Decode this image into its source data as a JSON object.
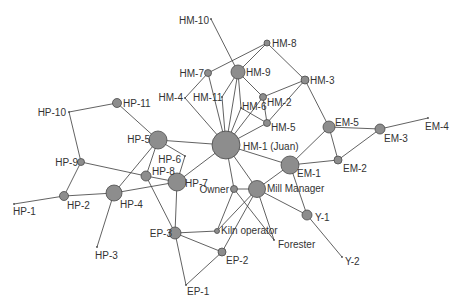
{
  "diagram": {
    "title": "",
    "colors": {
      "node_fill": "#8d8d8d",
      "node_stroke": "#4a4a4a",
      "edge": "#3a3a3a",
      "label": "#333333",
      "background": "#ffffff"
    },
    "nodes": [
      {
        "id": "HM-10",
        "label": "HM-10",
        "x": 211,
        "y": 19,
        "r": 0,
        "lx": 209,
        "ly": 24,
        "anchor": "end"
      },
      {
        "id": "HM-8",
        "label": "HM-8",
        "x": 267,
        "y": 43,
        "r": 3,
        "lx": 272,
        "ly": 47,
        "anchor": "start"
      },
      {
        "id": "HM-7",
        "label": "HM-7",
        "x": 208,
        "y": 73,
        "r": 3.5,
        "lx": 204,
        "ly": 77,
        "anchor": "end"
      },
      {
        "id": "HM-9",
        "label": "HM-9",
        "x": 238,
        "y": 72,
        "r": 7,
        "lx": 246,
        "ly": 76,
        "anchor": "start"
      },
      {
        "id": "HM-3",
        "label": "HM-3",
        "x": 305,
        "y": 80,
        "r": 4,
        "lx": 310,
        "ly": 84,
        "anchor": "start"
      },
      {
        "id": "HM-4",
        "label": "HM-4",
        "x": 185,
        "y": 98,
        "r": 0,
        "lx": 183,
        "ly": 101,
        "anchor": "end"
      },
      {
        "id": "HM-11",
        "label": "HM-11",
        "x": 222,
        "y": 97,
        "r": 0,
        "lx": 193,
        "ly": 101,
        "anchor": "start"
      },
      {
        "id": "HM-2",
        "label": "HM-2",
        "x": 263,
        "y": 97,
        "r": 3.5,
        "lx": 267,
        "ly": 106,
        "anchor": "start"
      },
      {
        "id": "HM-6",
        "label": "HM-6",
        "x": 241,
        "y": 108,
        "r": 0,
        "lx": 242,
        "ly": 110,
        "anchor": "start"
      },
      {
        "id": "HM-5",
        "label": "HM-5",
        "x": 267,
        "y": 123,
        "r": 3.5,
        "lx": 271,
        "ly": 131,
        "anchor": "start"
      },
      {
        "id": "HM-1",
        "label": "HM-1 (Juan)",
        "x": 226,
        "y": 145,
        "r": 14,
        "lx": 243,
        "ly": 150,
        "anchor": "start"
      },
      {
        "id": "EM-5",
        "label": "EM-5",
        "x": 329,
        "y": 127,
        "r": 6,
        "lx": 335,
        "ly": 126,
        "anchor": "start"
      },
      {
        "id": "EM-3",
        "label": "EM-3",
        "x": 380,
        "y": 129,
        "r": 5,
        "lx": 384,
        "ly": 142,
        "anchor": "start"
      },
      {
        "id": "EM-4",
        "label": "EM-4",
        "x": 428,
        "y": 118,
        "r": 0,
        "lx": 425,
        "ly": 130,
        "anchor": "start"
      },
      {
        "id": "EM-2",
        "label": "EM-2",
        "x": 338,
        "y": 160,
        "r": 4,
        "lx": 343,
        "ly": 172,
        "anchor": "start"
      },
      {
        "id": "EM-1",
        "label": "EM-1",
        "x": 290,
        "y": 165,
        "r": 9,
        "lx": 297,
        "ly": 177,
        "anchor": "start"
      },
      {
        "id": "HP-11",
        "label": "HP-11",
        "x": 117,
        "y": 103,
        "r": 4.5,
        "lx": 123,
        "ly": 107,
        "anchor": "start"
      },
      {
        "id": "HP-10",
        "label": "HP-10",
        "x": 69,
        "y": 112,
        "r": 0,
        "lx": 66,
        "ly": 116,
        "anchor": "end"
      },
      {
        "id": "HP-9",
        "label": "HP-9",
        "x": 81,
        "y": 162,
        "r": 3.5,
        "lx": 78,
        "ly": 166,
        "anchor": "end"
      },
      {
        "id": "HP-5",
        "label": "HP-5",
        "x": 158,
        "y": 140,
        "r": 9,
        "lx": 150,
        "ly": 143,
        "anchor": "end"
      },
      {
        "id": "HP-6",
        "label": "HP-6",
        "x": 185,
        "y": 156,
        "r": 0,
        "lx": 181,
        "ly": 163,
        "anchor": "end"
      },
      {
        "id": "HP-8",
        "label": "HP-8",
        "x": 146,
        "y": 176,
        "r": 5,
        "lx": 152,
        "ly": 175,
        "anchor": "start"
      },
      {
        "id": "HP-7",
        "label": "HP-7",
        "x": 177,
        "y": 182,
        "r": 9,
        "lx": 185,
        "ly": 187,
        "anchor": "start"
      },
      {
        "id": "HP-2",
        "label": "HP-2",
        "x": 64,
        "y": 196,
        "r": 4.5,
        "lx": 67,
        "ly": 209,
        "anchor": "start"
      },
      {
        "id": "HP-4",
        "label": "HP-4",
        "x": 114,
        "y": 193,
        "r": 8,
        "lx": 120,
        "ly": 208,
        "anchor": "start"
      },
      {
        "id": "HP-1",
        "label": "HP-1",
        "x": 14,
        "y": 204,
        "r": 0,
        "lx": 13,
        "ly": 215,
        "anchor": "start"
      },
      {
        "id": "HP-3",
        "label": "HP-3",
        "x": 97,
        "y": 247,
        "r": 0,
        "lx": 95,
        "ly": 259,
        "anchor": "start"
      },
      {
        "id": "EP-3",
        "label": "EP-3",
        "x": 175,
        "y": 233,
        "r": 6,
        "lx": 172,
        "ly": 237,
        "anchor": "end"
      },
      {
        "id": "Kiln operator",
        "label": "Kiln operator",
        "x": 217,
        "y": 231,
        "r": 2.5,
        "lx": 221,
        "ly": 234,
        "anchor": "start"
      },
      {
        "id": "EP-2",
        "label": "EP-2",
        "x": 222,
        "y": 252,
        "r": 4,
        "lx": 226,
        "ly": 264,
        "anchor": "start"
      },
      {
        "id": "EP-1",
        "label": "EP-1",
        "x": 186,
        "y": 285,
        "r": 0,
        "lx": 187,
        "ly": 295,
        "anchor": "start"
      },
      {
        "id": "Owner",
        "label": "Owner",
        "x": 234,
        "y": 189,
        "r": 3.5,
        "lx": 229,
        "ly": 193,
        "anchor": "end"
      },
      {
        "id": "Mill Manager",
        "label": "Mill Manager",
        "x": 257,
        "y": 189,
        "r": 8.5,
        "lx": 267,
        "ly": 192,
        "anchor": "start"
      },
      {
        "id": "Forester",
        "label": "Forester",
        "x": 274,
        "y": 240,
        "r": 0,
        "lx": 278,
        "ly": 248,
        "anchor": "start"
      },
      {
        "id": "Y-1",
        "label": "Y-1",
        "x": 307,
        "y": 215,
        "r": 5,
        "lx": 315,
        "ly": 221,
        "anchor": "start"
      },
      {
        "id": "Y-2",
        "label": "Y-2",
        "x": 342,
        "y": 257,
        "r": 0,
        "lx": 345,
        "ly": 265,
        "anchor": "start"
      }
    ],
    "edges": [
      [
        "HM-10",
        "HM-9"
      ],
      [
        "HM-8",
        "HM-7"
      ],
      [
        "HM-8",
        "HM-9"
      ],
      [
        "HM-8",
        "HM-3"
      ],
      [
        "HM-7",
        "HM-4"
      ],
      [
        "HM-7",
        "HM-1"
      ],
      [
        "HM-4",
        "HM-1"
      ],
      [
        "HM-9",
        "HM-11"
      ],
      [
        "HM-11",
        "HM-1"
      ],
      [
        "HM-9",
        "HM-1"
      ],
      [
        "HM-9",
        "HM-6"
      ],
      [
        "HM-9",
        "HM-2"
      ],
      [
        "HM-6",
        "HM-1"
      ],
      [
        "HM-6",
        "HM-5"
      ],
      [
        "HM-2",
        "HM-1"
      ],
      [
        "HM-2",
        "HM-5"
      ],
      [
        "HM-2",
        "HM-3"
      ],
      [
        "HM-5",
        "HM-3"
      ],
      [
        "HM-5",
        "HM-1"
      ],
      [
        "HM-3",
        "EM-5"
      ],
      [
        "EM-5",
        "EM-1"
      ],
      [
        "EM-5",
        "EM-2"
      ],
      [
        "EM-5",
        "EM-3"
      ],
      [
        "EM-3",
        "EM-4"
      ],
      [
        "EM-3",
        "EM-2"
      ],
      [
        "EM-2",
        "EM-1"
      ],
      [
        "EM-1",
        "HM-1"
      ],
      [
        "EM-1",
        "Y-1"
      ],
      [
        "EM-1",
        "Mill Manager"
      ],
      [
        "Y-1",
        "Y-2"
      ],
      [
        "Y-1",
        "Mill Manager"
      ],
      [
        "Mill Manager",
        "HM-1"
      ],
      [
        "Mill Manager",
        "Owner"
      ],
      [
        "Mill Manager",
        "Forester"
      ],
      [
        "Mill Manager",
        "Kiln operator"
      ],
      [
        "Mill Manager",
        "EP-2"
      ],
      [
        "Owner",
        "HM-1"
      ],
      [
        "Owner",
        "Kiln operator"
      ],
      [
        "Owner",
        "Forester"
      ],
      [
        "EP-3",
        "Kiln operator"
      ],
      [
        "EP-3",
        "EP-2"
      ],
      [
        "EP-3",
        "EP-1"
      ],
      [
        "EP-2",
        "EP-1"
      ],
      [
        "EP-3",
        "HP-7"
      ],
      [
        "EP-3",
        "HP-8"
      ],
      [
        "HP-7",
        "HM-1"
      ],
      [
        "HP-7",
        "HP-6"
      ],
      [
        "HP-7",
        "HP-8"
      ],
      [
        "HP-7",
        "HP-4"
      ],
      [
        "HP-8",
        "HP-9"
      ],
      [
        "HP-8",
        "HP-5"
      ],
      [
        "HP-5",
        "HP-6"
      ],
      [
        "HP-5",
        "HM-1"
      ],
      [
        "HP-5",
        "HP-11"
      ],
      [
        "HP-5",
        "HP-4"
      ],
      [
        "HP-11",
        "HP-10"
      ],
      [
        "HP-10",
        "HP-9"
      ],
      [
        "HP-9",
        "HP-2"
      ],
      [
        "HP-2",
        "HP-1"
      ],
      [
        "HP-2",
        "HP-4"
      ],
      [
        "HP-4",
        "HP-3"
      ]
    ]
  }
}
